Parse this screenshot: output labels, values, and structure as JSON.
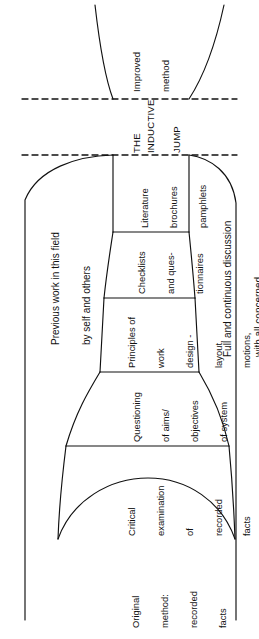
{
  "figure": {
    "orientation": "rotated-90",
    "stages": [
      {
        "id": "original-method",
        "lines": [
          "Original",
          "method:",
          "recorded",
          "facts"
        ]
      },
      {
        "id": "critical-examination",
        "lines": [
          "Critical",
          "examination",
          "of",
          "recorded",
          "facts"
        ]
      },
      {
        "id": "questioning-aims",
        "lines": [
          "Questioning",
          "of aims/",
          "objectives",
          "of system"
        ]
      },
      {
        "id": "principles-of-work-design",
        "lines": [
          "Principles of",
          "work",
          "design -",
          "layout,",
          "motions,",
          "movement,",
          "form design,",
          "etc."
        ]
      },
      {
        "id": "checklists-questionnaires",
        "lines": [
          "Checklists",
          "and ques-",
          "tionnaires"
        ]
      },
      {
        "id": "literature",
        "lines": [
          "Literature",
          "brochures",
          "pamphlets"
        ]
      }
    ],
    "side_labels": {
      "left": [
        "Previous work in this field",
        "by self and others"
      ],
      "right": [
        "Full and continuous discussion",
        "with all concerned"
      ]
    },
    "jump": {
      "words": [
        "THE",
        "INDUCTIVE",
        "JUMP"
      ]
    },
    "outcome": {
      "lines": [
        "Improved",
        "method"
      ]
    },
    "colors": {
      "stroke": "#111111",
      "background": "#ffffff",
      "text": "#111111"
    }
  }
}
